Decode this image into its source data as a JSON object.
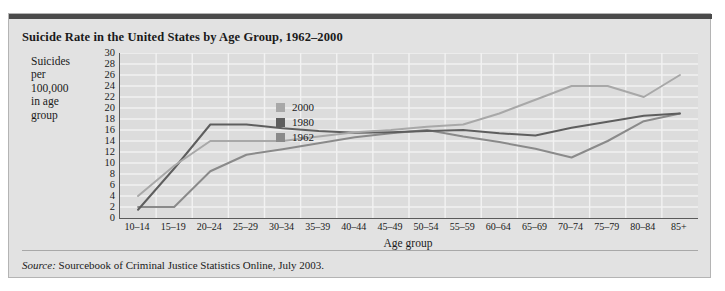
{
  "title": "Suicide Rate in the United States by Age Group, 1962–2000",
  "source": {
    "label": "Source:",
    "text": " Sourcebook of Criminal Justice Statistics Online, July 2003."
  },
  "legend": {
    "items": [
      {
        "label": "2000",
        "color": "#a8a8a8"
      },
      {
        "label": "1980",
        "color": "#5e5e5e"
      },
      {
        "label": "1962",
        "color": "#8a8a8a"
      }
    ]
  },
  "chart_data": {
    "type": "line",
    "title": "Suicide Rate in the United States by Age Group, 1962–2000",
    "xlabel": "Age group",
    "ylabel": "Suicides per 100,000 in age group",
    "ylabel_lines": [
      "Suicides",
      "per",
      "100,000",
      "in age",
      "group"
    ],
    "categories": [
      "10–14",
      "15–19",
      "20–24",
      "25–29",
      "30–34",
      "35–39",
      "40–44",
      "45–49",
      "50–54",
      "55–59",
      "60–64",
      "65–69",
      "70–74",
      "75–79",
      "80–84",
      "85+"
    ],
    "ylim": [
      0,
      30
    ],
    "yticks": [
      0,
      2,
      4,
      6,
      8,
      10,
      12,
      14,
      16,
      18,
      20,
      22,
      24,
      26,
      28,
      30
    ],
    "grid": true,
    "legend_position": "inside-upper-center",
    "series": [
      {
        "name": "2000",
        "color": "#a8a8a8",
        "values": [
          4.0,
          9.5,
          14.0,
          14.0,
          14.0,
          14.8,
          15.6,
          16.0,
          16.6,
          17.0,
          19.0,
          21.5,
          24.0,
          24.0,
          22.0,
          26.0
        ]
      },
      {
        "name": "1980",
        "color": "#5e5e5e",
        "values": [
          1.5,
          9.0,
          17.0,
          17.0,
          16.3,
          15.8,
          15.5,
          15.6,
          15.8,
          16.0,
          15.4,
          15.0,
          16.4,
          17.5,
          18.6,
          19.0
        ]
      },
      {
        "name": "1962",
        "color": "#8a8a8a",
        "values": [
          2.0,
          2.0,
          8.5,
          11.5,
          12.5,
          13.6,
          14.7,
          15.4,
          16.0,
          14.8,
          13.8,
          12.6,
          11.0,
          14.0,
          17.6,
          19.0
        ]
      }
    ]
  }
}
